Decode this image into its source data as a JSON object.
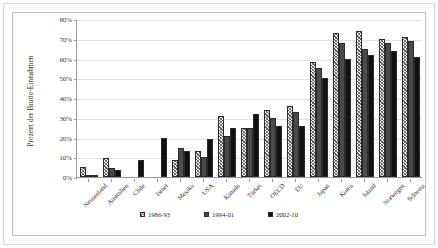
{
  "chart_data": {
    "type": "bar",
    "title": "",
    "subtitle": "",
    "xlabel": "",
    "ylabel": "Prozent der Brutto-Einnahmen",
    "ylim": [
      0,
      80
    ],
    "ytick_values": [
      0,
      10,
      20,
      30,
      40,
      50,
      60,
      70,
      80
    ],
    "ytick_labels": [
      "0%",
      "10%",
      "20%",
      "30%",
      "40%",
      "50%",
      "60%",
      "70%",
      "80%"
    ],
    "grid": true,
    "legend_position": "bottom",
    "categories": [
      "Neuseeland",
      "Australien",
      "Chile",
      "Israel",
      "Mexiko",
      "USA",
      "Kanada",
      "Türkei",
      "OECD",
      "EU",
      "Japan",
      "Korea",
      "Island",
      "Norwegen",
      "Schweiz"
    ],
    "series": [
      {
        "name": "1986-93",
        "fill": "hatched",
        "color": "#f2f2f2",
        "values": [
          5,
          9.5,
          0,
          0,
          8.5,
          13,
          31,
          25,
          34,
          36,
          58,
          73,
          74,
          70,
          71
        ]
      },
      {
        "name": "1994-01",
        "fill": "solid-gray",
        "color": "#4a4a4a",
        "values": [
          0.6,
          4.5,
          0,
          0,
          14.5,
          10,
          21,
          25,
          30,
          33,
          55,
          68,
          65,
          68,
          69
        ]
      },
      {
        "name": "2002-10",
        "fill": "solid-black",
        "color": "#111111",
        "values": [
          0.7,
          3.5,
          8.5,
          20,
          13,
          19,
          25,
          32,
          26,
          26,
          50,
          60,
          62,
          64,
          61
        ]
      }
    ]
  },
  "legend": {
    "items": [
      {
        "label": "1986-93"
      },
      {
        "label": "1994-01"
      },
      {
        "label": "2002-10"
      }
    ]
  }
}
